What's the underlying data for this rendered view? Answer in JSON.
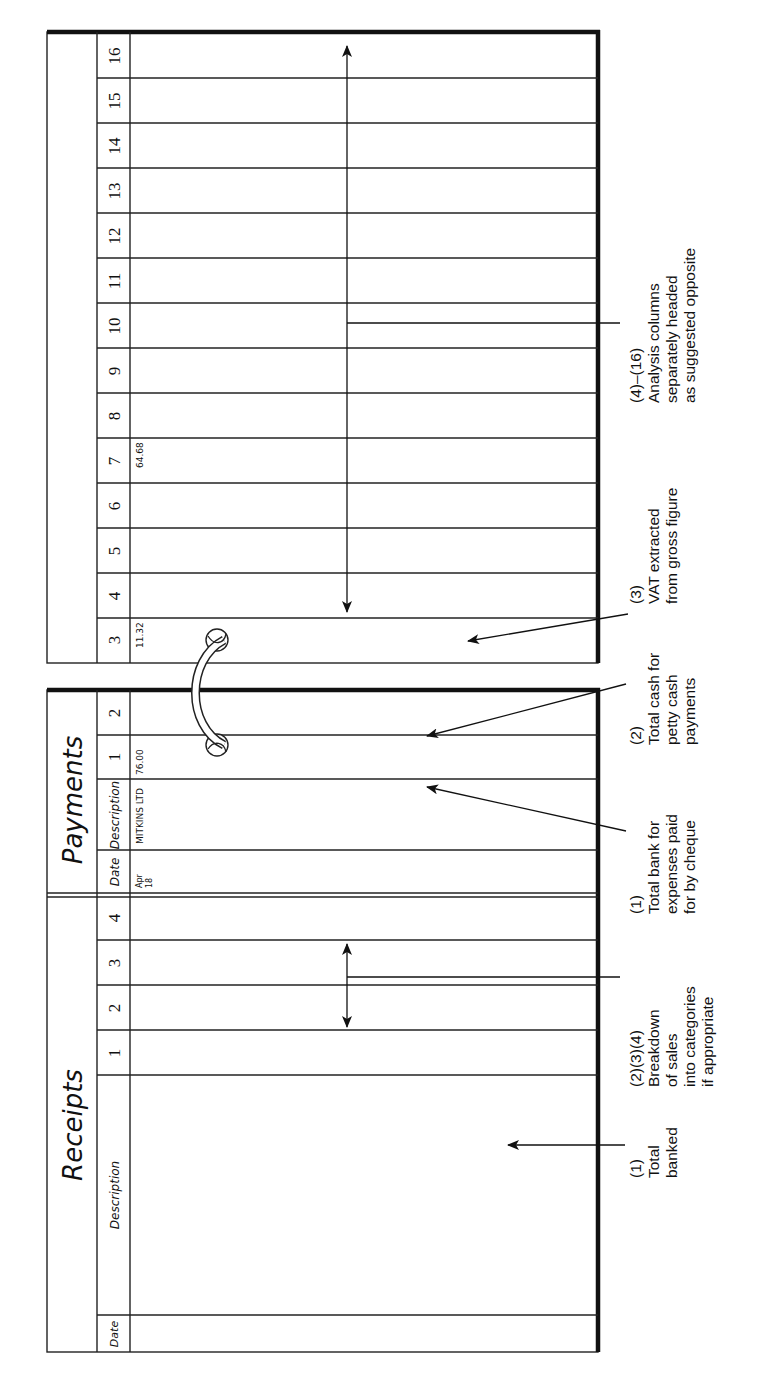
{
  "figure": {
    "receipts_page": {
      "title": "Receipts",
      "columns": [
        "Date",
        "Description",
        "1",
        "2",
        "3",
        "4"
      ]
    },
    "payments_page": {
      "title": "Payments",
      "columns": [
        "Date",
        "Description",
        "1",
        "2"
      ],
      "entry": {
        "date_month": "Apr",
        "date_day": "18",
        "description": "MITKINS LTD",
        "col1": "76.00"
      }
    },
    "analysis_page": {
      "columns": [
        "3",
        "4",
        "5",
        "6",
        "7",
        "8",
        "9",
        "10",
        "11",
        "12",
        "13",
        "14",
        "15",
        "16"
      ],
      "entry": {
        "col3": "11.32",
        "col7": "64.68"
      }
    },
    "annotations": [
      {
        "id": "receipts-1",
        "lines": [
          "(1)",
          "Total",
          "banked"
        ]
      },
      {
        "id": "receipts-234",
        "lines": [
          "(2)(3)(4)",
          "Breakdown",
          "of sales",
          "into categories",
          "if appropriate"
        ]
      },
      {
        "id": "payments-1",
        "lines": [
          "(1)",
          "Total bank for",
          "expenses paid",
          "for by cheque"
        ]
      },
      {
        "id": "payments-2",
        "lines": [
          "(2)",
          "Total cash for",
          "petty cash",
          "payments"
        ]
      },
      {
        "id": "analysis-3",
        "lines": [
          "(3)",
          "VAT extracted",
          "from gross figure"
        ]
      },
      {
        "id": "analysis-4-16",
        "lines": [
          "(4)–(16)",
          "Analysis columns",
          "separately headed",
          "as suggested opposite"
        ]
      }
    ],
    "binder_ring_icon": "ring-binder-icon"
  }
}
